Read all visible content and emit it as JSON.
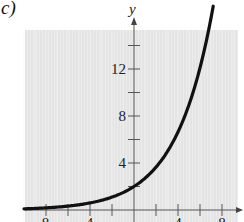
{
  "panel_label": "c)",
  "chart_data": {
    "type": "line",
    "title": "",
    "panel": "c)",
    "xlabel": "",
    "ylabel": "y",
    "xlim": [
      -10,
      9.5
    ],
    "ylim": [
      -1,
      16
    ],
    "grid": true,
    "background_color": "#e6e6e6",
    "curve_color": "#111111",
    "x_ticks": [
      -8,
      -6,
      -4,
      -2,
      0,
      2,
      4,
      6,
      8
    ],
    "x_tick_labels_visible": [
      "-8",
      "-4",
      "4",
      "8"
    ],
    "y_ticks": [
      2,
      4,
      6,
      8,
      10,
      12,
      14
    ],
    "y_tick_labels": [
      "4",
      "8",
      "12"
    ],
    "series": [
      {
        "name": "exponential curve",
        "x": [
          -10,
          -8,
          -6,
          -4,
          -2,
          0,
          1,
          2,
          3,
          4,
          5,
          6,
          7
        ],
        "y": [
          0.1,
          0.18,
          0.33,
          0.6,
          1.1,
          2.0,
          2.7,
          3.64,
          4.92,
          6.64,
          8.96,
          12.1,
          16.3
        ]
      }
    ],
    "legend": null
  }
}
